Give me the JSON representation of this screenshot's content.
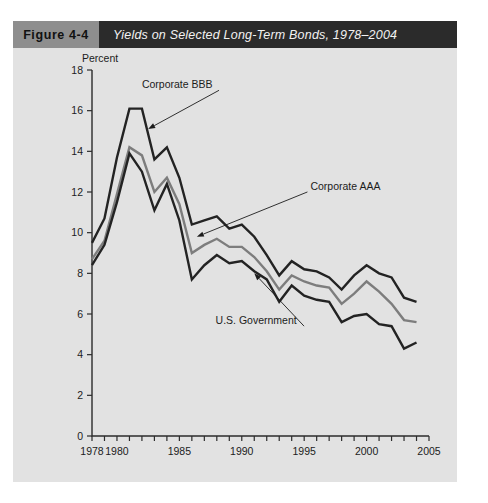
{
  "figure": {
    "number_label": "Figure 4-4",
    "title": "Yields on Selected Long-Term Bonds, 1978–2004",
    "number_bg": "#8e8e8e",
    "title_bg": "#2b2b2b",
    "panel_bg": "#e2e2e2"
  },
  "chart_data": {
    "type": "line",
    "title": "Yields on Selected Long-Term Bonds, 1978–2004",
    "xlabel": "",
    "ylabel": "Percent",
    "ylim": [
      0,
      18
    ],
    "xlim": [
      1978,
      2005
    ],
    "ytick_step": 2,
    "yticks": [
      0,
      2,
      4,
      6,
      8,
      10,
      12,
      14,
      16,
      18
    ],
    "ytick_labels": [
      "0",
      "2",
      "4",
      "6",
      "8",
      "10",
      "12",
      "14",
      "16",
      "18"
    ],
    "xticks": [
      1978,
      1979,
      1980,
      1981,
      1982,
      1983,
      1984,
      1985,
      1986,
      1987,
      1988,
      1989,
      1990,
      1991,
      1992,
      1993,
      1994,
      1995,
      1996,
      1997,
      1998,
      1999,
      2000,
      2001,
      2002,
      2003,
      2004,
      2005
    ],
    "xtick_labels_shown": [
      "1978",
      "1980",
      "1985",
      "1990",
      "1995",
      "2000",
      "2005"
    ],
    "xtick_label_years": [
      1978,
      1980,
      1985,
      1990,
      1995,
      2000,
      2005
    ],
    "grid": false,
    "legend": "inline-annotations",
    "x": [
      1978,
      1979,
      1980,
      1981,
      1982,
      1983,
      1984,
      1985,
      1986,
      1987,
      1988,
      1989,
      1990,
      1991,
      1992,
      1993,
      1994,
      1995,
      1996,
      1997,
      1998,
      1999,
      2000,
      2001,
      2002,
      2003,
      2004
    ],
    "series": [
      {
        "name": "Corporate BBB",
        "color": "#232323",
        "width": 2.4,
        "values": [
          9.5,
          10.7,
          13.7,
          16.1,
          16.1,
          13.6,
          14.2,
          12.7,
          10.4,
          10.6,
          10.8,
          10.2,
          10.4,
          9.8,
          8.9,
          7.9,
          8.6,
          8.2,
          8.1,
          7.8,
          7.2,
          7.9,
          8.4,
          8.0,
          7.8,
          6.8,
          6.6
        ]
      },
      {
        "name": "Corporate AAA",
        "color": "#7d7d7d",
        "width": 2.4,
        "values": [
          8.7,
          9.6,
          11.9,
          14.2,
          13.8,
          12.0,
          12.7,
          11.4,
          9.0,
          9.4,
          9.7,
          9.3,
          9.3,
          8.8,
          8.1,
          7.2,
          7.9,
          7.6,
          7.4,
          7.3,
          6.5,
          7.0,
          7.6,
          7.1,
          6.5,
          5.7,
          5.6
        ]
      },
      {
        "name": "U.S. Government",
        "color": "#232323",
        "width": 2.4,
        "values": [
          8.4,
          9.4,
          11.5,
          13.9,
          13.0,
          11.1,
          12.4,
          10.6,
          7.7,
          8.4,
          8.9,
          8.5,
          8.6,
          8.1,
          7.7,
          6.6,
          7.4,
          6.9,
          6.7,
          6.6,
          5.6,
          5.9,
          6.0,
          5.5,
          5.4,
          4.3,
          4.6
        ]
      }
    ],
    "annotations": [
      {
        "text": "Corporate BBB",
        "label_x": 1982.0,
        "label_y": 17.1,
        "point_x": 1982.5,
        "point_y": 15.1
      },
      {
        "text": "Corporate AAA",
        "label_x": 1995.5,
        "label_y": 12.1,
        "point_x": 1986.4,
        "point_y": 9.8
      },
      {
        "text": "U.S. Government",
        "label_x": 1987.9,
        "label_y": 5.5,
        "point_x": 1991.0,
        "point_y": 8.0
      }
    ]
  }
}
